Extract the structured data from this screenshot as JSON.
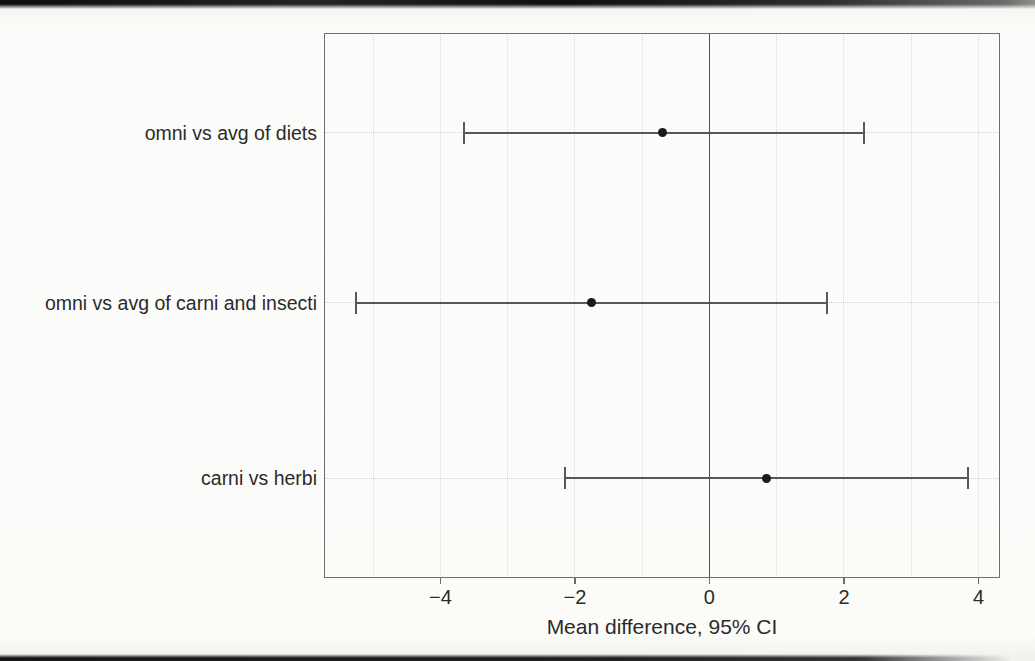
{
  "chart_data": {
    "type": "forest",
    "title": "",
    "xlabel": "Mean difference, 95% CI",
    "xlim": [
      -5.73,
      4.32
    ],
    "x_ticks": [
      -4,
      -2,
      0,
      2,
      4
    ],
    "x_minor_grid_step": 1,
    "reference_line_x": 0,
    "grid": "on",
    "legend": "none",
    "rows": [
      {
        "label": "omni vs avg of diets",
        "estimate": -0.7,
        "ci_low": -3.65,
        "ci_high": 2.3
      },
      {
        "label": "omni vs avg of carni and insecti",
        "estimate": -1.75,
        "ci_low": -5.25,
        "ci_high": 1.75
      },
      {
        "label": "carni vs herbi",
        "estimate": 0.85,
        "ci_low": -2.15,
        "ci_high": 3.85
      }
    ],
    "colors": {
      "marker": "#1a1a1a",
      "ci_line": "#585858",
      "axis_border": "#6e6e6e",
      "zero_line": "#4d4d4d",
      "minor_grid": "#dadad6",
      "row_guide": "#d2d2ce",
      "text": "#2b2b2b"
    }
  }
}
